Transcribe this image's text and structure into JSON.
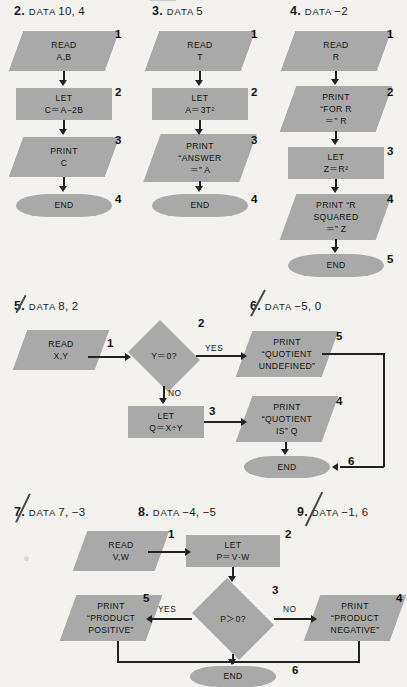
{
  "page": {
    "background_color": "#f4f2ef",
    "shape_fill_color": "#a9a9a9",
    "line_color": "#222222"
  },
  "problems": [
    {
      "id": "p2",
      "number": "2.",
      "keyword": "DATA",
      "value": "10, 4",
      "pen_mark": false
    },
    {
      "id": "p3",
      "number": "3.",
      "keyword": "DATA",
      "value": "5",
      "pen_mark": false
    },
    {
      "id": "p4",
      "number": "4.",
      "keyword": "DATA",
      "value": "−2",
      "pen_mark": false
    },
    {
      "id": "p5",
      "number": "5.",
      "keyword": "DATA",
      "value": "8, 2",
      "pen_mark": true
    },
    {
      "id": "p6",
      "number": "6.",
      "keyword": "DATA",
      "value": "−5, 0",
      "pen_mark": true
    },
    {
      "id": "p7",
      "number": "7.",
      "keyword": "DATA",
      "value": "7, −3",
      "pen_mark": true
    },
    {
      "id": "p8",
      "number": "8.",
      "keyword": "DATA",
      "value": "−4, −5",
      "pen_mark": false
    },
    {
      "id": "p9",
      "number": "9.",
      "keyword": "DATA",
      "value": "−1, 6",
      "pen_mark": true
    }
  ],
  "flowcharts": [
    {
      "id": "chart_a",
      "for_problem": "2.",
      "nodes": [
        {
          "step": "1",
          "shape": "parallelogram",
          "lines": [
            "READ",
            "A,B"
          ]
        },
        {
          "step": "2",
          "shape": "rectangle",
          "lines": [
            "LET",
            "C＝A−2B"
          ]
        },
        {
          "step": "3",
          "shape": "parallelogram",
          "lines": [
            "PRINT",
            "C"
          ]
        },
        {
          "step": "4",
          "shape": "terminator",
          "lines": [
            "END"
          ]
        }
      ]
    },
    {
      "id": "chart_b",
      "for_problem": "3.",
      "nodes": [
        {
          "step": "1",
          "shape": "parallelogram",
          "lines": [
            "READ",
            "T"
          ]
        },
        {
          "step": "2",
          "shape": "rectangle",
          "lines": [
            "LET",
            "A＝3T²"
          ]
        },
        {
          "step": "3",
          "shape": "parallelogram",
          "lines": [
            "PRINT",
            "“ANSWER",
            "＝” A"
          ]
        },
        {
          "step": "4",
          "shape": "terminator",
          "lines": [
            "END"
          ]
        }
      ]
    },
    {
      "id": "chart_c",
      "for_problem": "4.",
      "nodes": [
        {
          "step": "1",
          "shape": "parallelogram",
          "lines": [
            "READ",
            "R"
          ]
        },
        {
          "step": "2",
          "shape": "parallelogram",
          "lines": [
            "PRINT",
            "“FOR R",
            "＝” R"
          ]
        },
        {
          "step": "3",
          "shape": "rectangle",
          "lines": [
            "LET",
            "Z＝R²"
          ]
        },
        {
          "step": "4",
          "shape": "parallelogram",
          "lines": [
            "PRINT “R",
            "SQUARED",
            "＝” Z"
          ]
        },
        {
          "step": "5",
          "shape": "terminator",
          "lines": [
            "END"
          ]
        }
      ]
    },
    {
      "id": "chart_d",
      "for_problem": "5.",
      "nodes": [
        {
          "step": "1",
          "shape": "parallelogram",
          "lines": [
            "READ",
            "X,Y"
          ]
        },
        {
          "step": "2",
          "shape": "diamond",
          "lines": [
            "Y＝0?"
          ]
        },
        {
          "step": "3",
          "shape": "rectangle",
          "lines": [
            "LET",
            "Q＝X÷Y"
          ]
        },
        {
          "step": "4",
          "shape": "parallelogram",
          "lines": [
            "PRINT",
            "“QUOTIENT",
            "IS” Q"
          ]
        },
        {
          "step": "5",
          "shape": "parallelogram",
          "lines": [
            "PRINT",
            "“QUOTIENT",
            "UNDEFINED”"
          ]
        },
        {
          "step": "6",
          "shape": "terminator",
          "lines": [
            "END"
          ]
        }
      ],
      "edge_labels": {
        "yes": "YES",
        "no": "NO"
      }
    },
    {
      "id": "chart_e",
      "for_problem": "8.",
      "nodes": [
        {
          "step": "1",
          "shape": "parallelogram",
          "lines": [
            "READ",
            "V,W"
          ]
        },
        {
          "step": "2",
          "shape": "rectangle",
          "lines": [
            "LET",
            "P＝V·W"
          ]
        },
        {
          "step": "3",
          "shape": "diamond",
          "lines": [
            "P＞0?"
          ]
        },
        {
          "step": "4",
          "shape": "parallelogram",
          "lines": [
            "PRINT",
            "“PRODUCT",
            "NEGATIVE”"
          ]
        },
        {
          "step": "5",
          "shape": "parallelogram",
          "lines": [
            "PRINT",
            "“PRODUCT",
            "POSITIVE”"
          ]
        },
        {
          "step": "6",
          "shape": "terminator",
          "lines": [
            "END"
          ]
        }
      ],
      "edge_labels": {
        "yes": "YES",
        "no": "NO"
      }
    }
  ]
}
